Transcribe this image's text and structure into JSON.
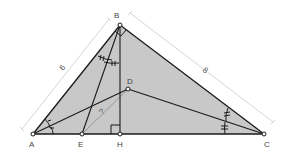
{
  "diagram": {
    "colors": {
      "fill": "#c8c8c8",
      "stroke": "#1a1a1a",
      "dimension_line": "#d0d0d0",
      "dashed_segment": "#8a8a8a",
      "label": "#444444"
    },
    "points": [
      {
        "name": "A",
        "label": "A",
        "x": 33,
        "y": 134
      },
      {
        "name": "B",
        "label": "B",
        "x": 120,
        "y": 25
      },
      {
        "name": "C",
        "label": "C",
        "x": 264,
        "y": 134
      },
      {
        "name": "D",
        "label": "D",
        "x": 128,
        "y": 89
      },
      {
        "name": "E",
        "label": "E",
        "x": 82,
        "y": 134
      },
      {
        "name": "H",
        "label": "H",
        "x": 120,
        "y": 134
      }
    ],
    "segments": [
      {
        "from": "A",
        "to": "B"
      },
      {
        "from": "B",
        "to": "C"
      },
      {
        "from": "A",
        "to": "C"
      },
      {
        "from": "B",
        "to": "H"
      },
      {
        "from": "B",
        "to": "E"
      },
      {
        "from": "A",
        "to": "D"
      },
      {
        "from": "D",
        "to": "C"
      },
      {
        "from": "E",
        "to": "D",
        "style": "thin-gray"
      }
    ],
    "dimensions": [
      {
        "segment": "AB",
        "label": "6"
      },
      {
        "segment": "BC",
        "label": "8"
      },
      {
        "segment": "ED",
        "label": "?"
      }
    ],
    "right_angles": [
      "B",
      "H"
    ],
    "angle_marks": [
      {
        "vertex": "B",
        "between": [
          "BA",
          "BE"
        ],
        "ticks": 2
      },
      {
        "vertex": "B",
        "between": [
          "BE",
          "BH"
        ],
        "ticks": 2
      },
      {
        "vertex": "A",
        "between": [
          "AB",
          "AD"
        ],
        "ticks": 1
      },
      {
        "vertex": "A",
        "between": [
          "AD",
          "AC"
        ],
        "ticks": 1
      },
      {
        "vertex": "C",
        "between": [
          "CB",
          "CD"
        ],
        "ticks": 2
      },
      {
        "vertex": "C",
        "between": [
          "CD",
          "CA"
        ],
        "ticks": 2
      }
    ]
  }
}
